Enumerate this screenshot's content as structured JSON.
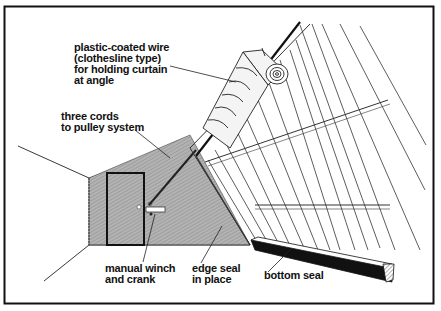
{
  "diagram": {
    "colors": {
      "ink": "#111111",
      "wall_fill": "#a9a9a9",
      "background": "#ffffff",
      "curtain_fill": "#f4f4f4"
    },
    "labels": [
      {
        "id": "wire",
        "lines": [
          "plastic-coated wire",
          "(clothesline type)",
          "for holding curtain",
          "at angle"
        ]
      },
      {
        "id": "cords",
        "lines": [
          "three cords",
          "to pulley system"
        ]
      },
      {
        "id": "winch",
        "lines": [
          "manual winch",
          "and crank"
        ]
      },
      {
        "id": "edge_seal",
        "lines": [
          "edge seal",
          "in place"
        ]
      },
      {
        "id": "bottom_seal",
        "lines": [
          "bottom seal"
        ]
      }
    ]
  }
}
